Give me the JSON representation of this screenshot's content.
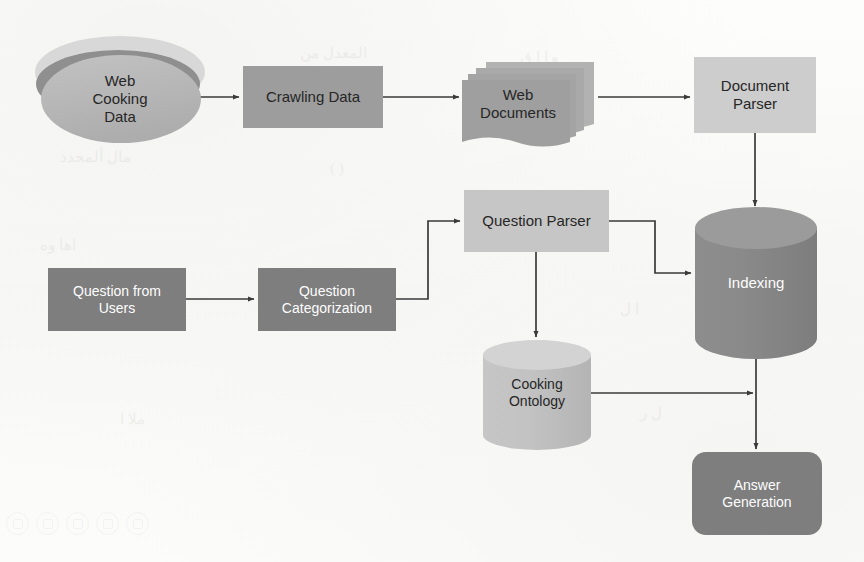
{
  "diagram": {
    "background_color": "#fbfbfa",
    "palette": {
      "dark_fill": "#7e7e7e",
      "medium_fill": "#9d9d9d",
      "light_fill": "#c9c9c9",
      "lighter_fill": "#d2d2d2",
      "stack_back": "#d8d8d8",
      "stack_mid": "#8f8f8f",
      "arrow_color": "#3a3a3a",
      "dark_text": "#262626",
      "light_text": "#fdfdfd"
    },
    "nodes": [
      {
        "id": "web-cooking-data",
        "label": "Web\nCooking\nData",
        "shape": "stacked-disc",
        "fill": "#b4b4b4",
        "text_color": "#262626",
        "x": 34,
        "y": 36,
        "w": 160,
        "h": 110
      },
      {
        "id": "crawling-data",
        "label": "Crawling Data",
        "shape": "rectangle",
        "fill": "#9d9d9d",
        "text_color": "#262626",
        "x": 243,
        "y": 66,
        "w": 140,
        "h": 62
      },
      {
        "id": "web-documents",
        "label": "Web\nDocuments",
        "shape": "document-stack",
        "fill": "#a2a2a2",
        "text_color": "#262626",
        "x": 462,
        "y": 62,
        "w": 132,
        "h": 78
      },
      {
        "id": "document-parser",
        "label": "Document\nParser",
        "shape": "rectangle",
        "fill": "#cdcdcd",
        "text_color": "#262626",
        "x": 694,
        "y": 57,
        "w": 122,
        "h": 76
      },
      {
        "id": "question-from-users",
        "label": "Question from\nUsers",
        "shape": "rectangle",
        "fill": "#7e7e7e",
        "text_color": "#fdfdfd",
        "x": 48,
        "y": 268,
        "w": 138,
        "h": 63
      },
      {
        "id": "question-categorization",
        "label": "Question\nCategorization",
        "shape": "rectangle",
        "fill": "#7e7e7e",
        "text_color": "#fdfdfd",
        "x": 258,
        "y": 268,
        "w": 138,
        "h": 63
      },
      {
        "id": "question-parser",
        "label": "Question Parser",
        "shape": "rectangle",
        "fill": "#c6c6c6",
        "text_color": "#262626",
        "x": 464,
        "y": 190,
        "w": 145,
        "h": 62
      },
      {
        "id": "indexing",
        "label": "Indexing",
        "shape": "cylinder",
        "fill": "#878787",
        "text_color": "#fdfdfd",
        "x": 695,
        "y": 207,
        "w": 122,
        "h": 152
      },
      {
        "id": "cooking-ontology",
        "label": "Cooking\nOntology",
        "shape": "cylinder",
        "fill": "#c0c0c0",
        "text_color": "#262626",
        "x": 483,
        "y": 340,
        "w": 108,
        "h": 110
      },
      {
        "id": "answer-generation",
        "label": "Answer\nGeneration",
        "shape": "rounded-rectangle",
        "fill": "#7e7e7e",
        "text_color": "#fdfdfd",
        "x": 692,
        "y": 452,
        "w": 130,
        "h": 83
      }
    ],
    "edges": [
      {
        "id": "edge-webdata-crawling",
        "from": "web-cooking-data",
        "to": "crawling-data",
        "route": "straight-right"
      },
      {
        "id": "edge-crawling-webdocs",
        "from": "crawling-data",
        "to": "web-documents",
        "route": "straight-right"
      },
      {
        "id": "edge-webdocs-docparser",
        "from": "web-documents",
        "to": "document-parser",
        "route": "straight-right"
      },
      {
        "id": "edge-docparser-indexing",
        "from": "document-parser",
        "to": "indexing",
        "route": "straight-down"
      },
      {
        "id": "edge-users-categorization",
        "from": "question-from-users",
        "to": "question-categorization",
        "route": "straight-right"
      },
      {
        "id": "edge-categorization-qparser",
        "from": "question-categorization",
        "to": "question-parser",
        "route": "right-up-right"
      },
      {
        "id": "edge-qparser-indexing",
        "from": "question-parser",
        "to": "indexing",
        "route": "right-down-right"
      },
      {
        "id": "edge-qparser-ontology",
        "from": "question-parser",
        "to": "cooking-ontology",
        "route": "straight-down"
      },
      {
        "id": "edge-ontology-answer",
        "from": "cooking-ontology",
        "to": "answer-generation",
        "route": "right-to-vertical"
      },
      {
        "id": "edge-indexing-answer",
        "from": "indexing",
        "to": "answer-generation",
        "route": "straight-down"
      }
    ]
  },
  "watermark": {
    "icon_names": [
      "circle-play-icon",
      "circle-pause-icon",
      "circle-gear-icon",
      "circle-search-icon",
      "circle-clock-icon"
    ]
  }
}
